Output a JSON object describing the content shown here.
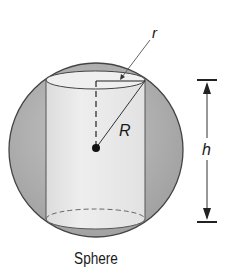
{
  "diagram": {
    "caption": "Sphere",
    "labels": {
      "small_radius": "r",
      "sphere_radius": "R",
      "height": "h"
    },
    "shapes": [
      {
        "name": "sphere",
        "type": "circle"
      },
      {
        "name": "inscribed-cylinder",
        "type": "cylinder"
      },
      {
        "name": "center-point",
        "type": "dot"
      }
    ],
    "colors": {
      "sphere_fill": "#a9a9a9",
      "cylinder_fill": "#e8e8e8",
      "stroke": "#333333"
    }
  }
}
